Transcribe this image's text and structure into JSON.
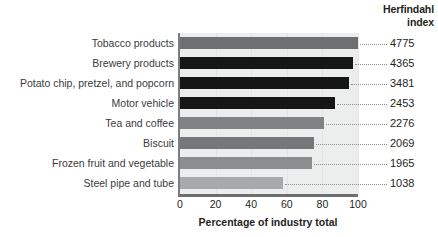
{
  "header": {
    "line1": "Herfindahl",
    "line2": "index"
  },
  "chart_data": {
    "type": "bar",
    "orientation": "horizontal",
    "title": "",
    "xlabel": "Percentage of industry total",
    "ylabel": "",
    "xlim": [
      0,
      100
    ],
    "xticks": [
      0,
      20,
      40,
      60,
      80,
      100
    ],
    "xticklabels": [
      "0",
      "20",
      "40",
      "60",
      "80",
      "100"
    ],
    "grid": true,
    "legend": false,
    "value_column_header": "Herfindahl index",
    "categories": [
      "Tobacco products",
      "Brewery products",
      "Potato chip, pretzel, and popcorn",
      "Motor vehicle",
      "Tea and coffee",
      "Biscuit",
      "Frozen fruit and vegetable",
      "Steel pipe and tube"
    ],
    "values": [
      100,
      97,
      95,
      87,
      81,
      75,
      74,
      58
    ],
    "herfindahl_index": [
      4775,
      4365,
      3481,
      2453,
      2276,
      2069,
      1965,
      1038
    ],
    "bar_colors": [
      "#6e6f71",
      "#161616",
      "#161616",
      "#161616",
      "#818284",
      "#76777a",
      "#8c8d8f",
      "#a8a9ab"
    ],
    "rows": [
      {
        "category": "Tobacco products",
        "value": 100,
        "index": "4775",
        "color": "#6e6f71"
      },
      {
        "category": "Brewery products",
        "value": 97,
        "index": "4365",
        "color": "#161616"
      },
      {
        "category": "Potato chip, pretzel, and popcorn",
        "value": 95,
        "index": "3481",
        "color": "#161616"
      },
      {
        "category": "Motor vehicle",
        "value": 87,
        "index": "2453",
        "color": "#161616"
      },
      {
        "category": "Tea and coffee",
        "value": 81,
        "index": "2276",
        "color": "#818284"
      },
      {
        "category": "Biscuit",
        "value": 75,
        "index": "2069",
        "color": "#76777a"
      },
      {
        "category": "Frozen fruit and vegetable",
        "value": 74,
        "index": "1965",
        "color": "#8c8d8f"
      },
      {
        "category": "Steel pipe and tube",
        "value": 58,
        "index": "1038",
        "color": "#a8a9ab"
      }
    ]
  },
  "colors": {
    "plot_background": "#eceded",
    "axis": "#6d6e70",
    "text": "#231f20"
  }
}
